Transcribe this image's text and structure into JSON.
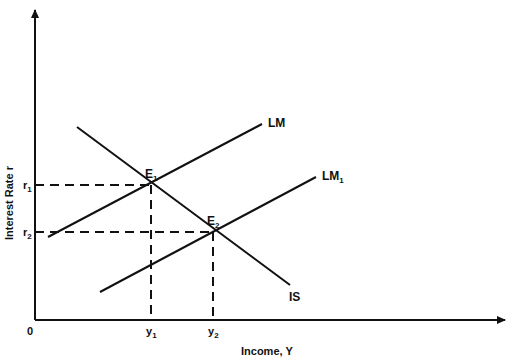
{
  "diagram": {
    "type": "IS-LM model",
    "axes": {
      "x_label": "Income, Y",
      "y_label": "Interest Rate r",
      "origin_label": "0"
    },
    "curves": {
      "is": {
        "label": "IS"
      },
      "lm": {
        "label": "LM"
      },
      "lm1": {
        "label": "LM",
        "subscript": "1"
      }
    },
    "points": {
      "e1": {
        "label": "E",
        "subscript": "1"
      },
      "e2": {
        "label": "E",
        "subscript": "2"
      }
    },
    "y_ticks": {
      "r1": {
        "label": "r",
        "subscript": "1"
      },
      "r2": {
        "label": "r",
        "subscript": "2"
      }
    },
    "x_ticks": {
      "y1": {
        "label": "y",
        "subscript": "1"
      },
      "y2": {
        "label": "y",
        "subscript": "2"
      }
    },
    "colors": {
      "line": "#111111",
      "background": "#ffffff"
    }
  }
}
